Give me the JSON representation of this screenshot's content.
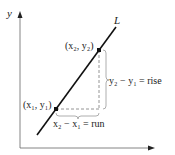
{
  "diagram": {
    "type": "slope-of-line",
    "axes": {
      "x_label": "",
      "y_label": "y"
    },
    "line_label": "L",
    "points": [
      {
        "id": "p1",
        "label": "(x₁, y₁)"
      },
      {
        "id": "p2",
        "label": "(x₂, y₂)"
      }
    ],
    "rise_label": "y₂ − y₁ = rise",
    "run_label": "x₂ − x₁ = run",
    "colors": {
      "line": "#111111",
      "axes": "#555555",
      "dashed": "#888888",
      "brace": "#999999"
    }
  }
}
